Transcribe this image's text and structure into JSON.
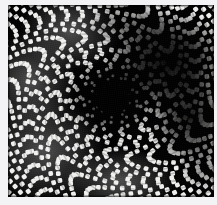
{
  "image": {
    "kind": "moire-halftone-photograph",
    "subject": "spiral vortex moire pattern of a warped square cell grid",
    "colorspace": "grayscale",
    "width": 217,
    "height": 205,
    "background_color": "#f3f3f5",
    "ink_color": "#000000",
    "highlight_color": "#f0f0ee",
    "caption": "",
    "plate": {
      "left": 8,
      "top": 5,
      "width": 206,
      "height": 192,
      "border_color": "#000000"
    },
    "pattern": {
      "cell_pitch_px": 7.6,
      "cell_shape": "rounded-square",
      "grid_rows": 27,
      "grid_cols": 29,
      "vortex_center_x": 112,
      "vortex_center_y": 98,
      "twist_turns": 1.15,
      "radial_arms": 34,
      "dark_lobe": {
        "x": 168,
        "y": 62,
        "rx": 62,
        "ry": 52
      },
      "dark_lobe_secondary": {
        "x": 186,
        "y": 118,
        "rx": 40,
        "ry": 46
      },
      "bright_zones": [
        {
          "x": 44,
          "y": 150,
          "r": 58
        },
        {
          "x": 70,
          "y": 30,
          "r": 48
        },
        {
          "x": 30,
          "y": 80,
          "r": 46
        },
        {
          "x": 120,
          "y": 178,
          "r": 52
        }
      ]
    },
    "margins": {
      "top": 5,
      "right": 3,
      "bottom": 8,
      "left": 8
    }
  }
}
